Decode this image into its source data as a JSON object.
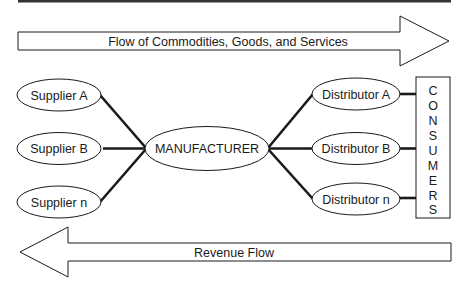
{
  "diagram": {
    "type": "supply-chain-flow",
    "top_arrow": {
      "label": "Flow of Commodities, Goods, and Services",
      "direction": "right"
    },
    "bottom_arrow": {
      "label": "Revenue Flow",
      "direction": "left"
    },
    "suppliers": [
      {
        "label": "Supplier A"
      },
      {
        "label": "Supplier B"
      },
      {
        "label": "Supplier n"
      }
    ],
    "manufacturer": {
      "label": "MANUFACTURER"
    },
    "distributors": [
      {
        "label": "Distributor A"
      },
      {
        "label": "Distributor B"
      },
      {
        "label": "Distributor n"
      }
    ],
    "consumers": {
      "label": "CONSUMERS",
      "letters": [
        "C",
        "O",
        "N",
        "S",
        "U",
        "M",
        "E",
        "R",
        "S"
      ]
    },
    "edges": [
      {
        "from": "Supplier A",
        "to": "MANUFACTURER"
      },
      {
        "from": "Supplier B",
        "to": "MANUFACTURER"
      },
      {
        "from": "Supplier n",
        "to": "MANUFACTURER"
      },
      {
        "from": "MANUFACTURER",
        "to": "Distributor A"
      },
      {
        "from": "MANUFACTURER",
        "to": "Distributor B"
      },
      {
        "from": "MANUFACTURER",
        "to": "Distributor n"
      },
      {
        "from": "Distributor A",
        "to": "CONSUMERS"
      },
      {
        "from": "Distributor B",
        "to": "CONSUMERS"
      },
      {
        "from": "Distributor n",
        "to": "CONSUMERS"
      }
    ],
    "colors": {
      "stroke": "#1a1a1a",
      "fill": "#ffffff",
      "top_rule": "#333333"
    }
  }
}
